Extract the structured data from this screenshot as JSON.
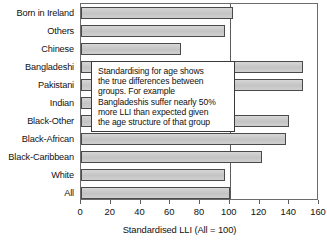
{
  "chart_data": {
    "type": "bar",
    "orientation": "horizontal",
    "title": "",
    "xlabel": "Standardised LLI (All = 100)",
    "ylabel": "",
    "xlim": [
      0,
      160
    ],
    "ylim": null,
    "grid": false,
    "legend": null,
    "reference_line": 100,
    "xticks": [
      0,
      20,
      40,
      60,
      80,
      100,
      120,
      140,
      160
    ],
    "xticklabels": [
      "0",
      "20",
      "40",
      "60",
      "80",
      "100",
      "120",
      "140",
      "160"
    ],
    "categories": [
      "Born in Ireland",
      "Others",
      "Chinese",
      "Bangladeshi",
      "Pakistani",
      "Indian",
      "Black-Other",
      "Black-African",
      "Black-Caribbean",
      "White",
      "All"
    ],
    "values": [
      102,
      97,
      67,
      149,
      149,
      92,
      140,
      138,
      122,
      97,
      100
    ],
    "annotations": [
      {
        "text": "Standardising for age shows the true differences between groups. For example Bangladeshis suffer nearly 50% more LLI than expected given the age structure of that group",
        "lines": [
          "Standardising for age shows",
          "the true differences between",
          "groups. For example",
          "Bangladeshis suffer nearly 50%",
          "more LLI than expected given",
          "the age structure of that group"
        ]
      }
    ],
    "colors": {
      "bar_fill": "#c9c9c9",
      "bar_edge": "#4a4a4a",
      "axis": "#6b6b6b",
      "text": "#111111",
      "background": "#ffffff"
    }
  }
}
